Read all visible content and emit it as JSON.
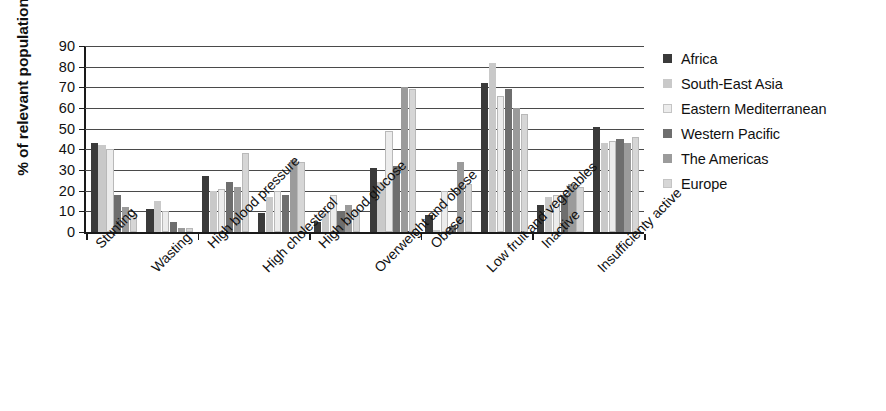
{
  "chart_data": {
    "type": "bar",
    "title": "",
    "subtitle": "",
    "xlabel": "",
    "ylabel": "% of relevant population",
    "ylim": [
      0,
      90
    ],
    "ytick_step": 10,
    "yticks": [
      90,
      80,
      70,
      60,
      50,
      40,
      30,
      20,
      10,
      0
    ],
    "grid": "horizontal",
    "legend_position": "right",
    "categories": [
      "Stunting",
      "Wasting",
      "High blood pressure",
      "High cholesterol",
      "High blood glucose",
      "Overweight and obese",
      "Obese",
      "Low fruit and vegetables",
      "Inactive",
      "Insufficienty active"
    ],
    "series": [
      {
        "name": "Africa",
        "color": "#3a3a3a",
        "values": [
          43,
          11,
          27,
          9,
          5,
          31,
          8,
          72,
          13,
          51
        ]
      },
      {
        "name": "South-East Asia",
        "color": "#c9c9c9",
        "values": [
          42,
          15,
          20,
          17,
          9,
          24,
          1,
          82,
          17,
          43
        ]
      },
      {
        "name": "Eastern Mediterranean",
        "color": "#ececec",
        "values": [
          40,
          10,
          21,
          20,
          18,
          49,
          20,
          66,
          18,
          44
        ]
      },
      {
        "name": "Western Pacific",
        "color": "#6e6e6e",
        "values": [
          18,
          5,
          24,
          18,
          10,
          32,
          3,
          69,
          18,
          45
        ]
      },
      {
        "name": "The Americas",
        "color": "#9b9b9b",
        "values": [
          12,
          2,
          22,
          35,
          13,
          70,
          34,
          60,
          23,
          43
        ]
      },
      {
        "name": "Europe",
        "color": "#d6d6d6",
        "values": [
          8,
          2,
          38,
          34,
          11,
          69,
          23,
          57,
          22,
          46
        ]
      }
    ]
  },
  "legend": {
    "items": [
      {
        "label": "Africa",
        "color": "#3a3a3a"
      },
      {
        "label": "South-East Asia",
        "color": "#c9c9c9"
      },
      {
        "label": "Eastern Mediterranean",
        "color": "#ececec"
      },
      {
        "label": "Western Pacific",
        "color": "#6e6e6e"
      },
      {
        "label": "The Americas",
        "color": "#9b9b9b"
      },
      {
        "label": "Europe",
        "color": "#d6d6d6"
      }
    ]
  }
}
